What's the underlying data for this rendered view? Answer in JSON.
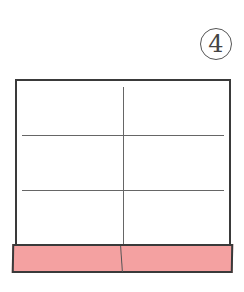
{
  "step_label": "4",
  "colors": {
    "band": "#f4a1a1",
    "outline": "#3a3a3a",
    "fold_line": "#666666"
  },
  "diagram": {
    "creases": {
      "horizontal": 2,
      "vertical": 1
    }
  }
}
